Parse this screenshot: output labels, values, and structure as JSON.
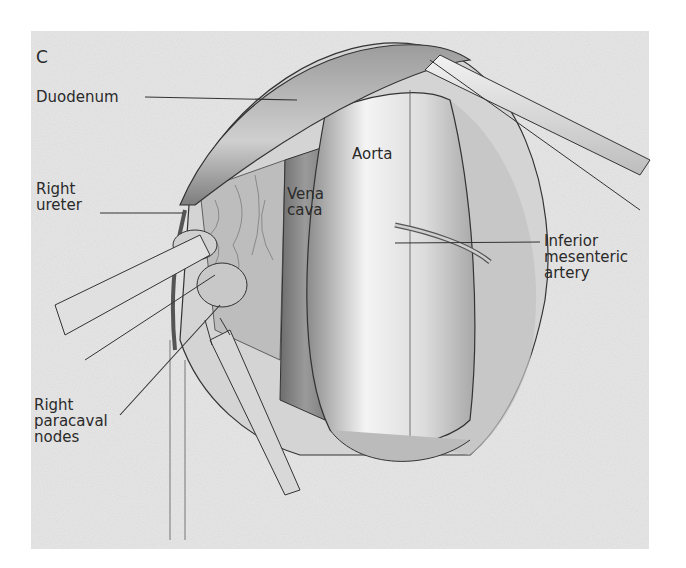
{
  "figure": {
    "panel_letter": "C",
    "labels": {
      "duodenum": "Duodenum",
      "right_ureter": "Right\nureter",
      "vena_cava": "Vena\ncava",
      "aorta": "Aorta",
      "inferior_mesenteric_artery": "Inferior\nmesenteric\nartery",
      "right_paracaval_nodes": "Right\nparacaval\nnodes"
    },
    "colors": {
      "background_texture": "#e9e9e9",
      "line": "#333333",
      "text": "#2a2a2a"
    }
  }
}
